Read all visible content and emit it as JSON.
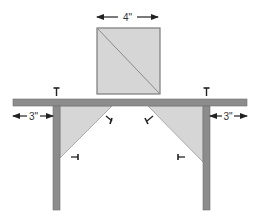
{
  "diagram": {
    "type": "shelf-bracket-construction",
    "colors": {
      "wood": "#8c8c8c",
      "wood_edge": "#6e6e6e",
      "gusset": "#d6d6d6",
      "gusset_edge": "#9a9a9a",
      "ink": "#222222",
      "background": "#ffffff"
    },
    "square_panel": {
      "dimension_label": "4\"",
      "has_diagonal_cut": true
    },
    "shelf_board": {
      "left_overhang_label": "3\"",
      "right_overhang_label": "3\""
    },
    "legs": [
      "left-leg",
      "right-leg"
    ],
    "triangular_gussets": [
      "left-gusset",
      "right-gusset"
    ],
    "screws": [
      {
        "name": "screw-top-left",
        "orientation": "vertical"
      },
      {
        "name": "screw-top-right",
        "orientation": "vertical"
      },
      {
        "name": "screw-left-gusset-top",
        "orientation": "diagonal"
      },
      {
        "name": "screw-left-gusset-side",
        "orientation": "horizontal"
      },
      {
        "name": "screw-right-gusset-top",
        "orientation": "diagonal"
      },
      {
        "name": "screw-right-gusset-side",
        "orientation": "horizontal"
      }
    ]
  }
}
